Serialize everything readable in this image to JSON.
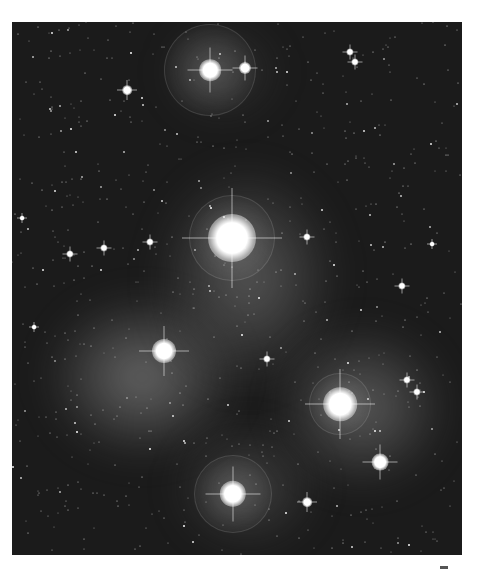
{
  "image": {
    "subject": "Pleiades star cluster with reflection nebula",
    "style": "grayscale astrophotograph",
    "bright_stars": [
      {
        "x": 198,
        "y": 48,
        "r": 9,
        "halo": 45
      },
      {
        "x": 233,
        "y": 46,
        "r": 5,
        "halo": 0
      },
      {
        "x": 220,
        "y": 216,
        "r": 20,
        "halo": 42
      },
      {
        "x": 152,
        "y": 329,
        "r": 10,
        "halo": 0
      },
      {
        "x": 328,
        "y": 382,
        "r": 14,
        "halo": 30
      },
      {
        "x": 368,
        "y": 440,
        "r": 7,
        "halo": 0
      },
      {
        "x": 221,
        "y": 472,
        "r": 11,
        "halo": 38
      },
      {
        "x": 115,
        "y": 68,
        "r": 4,
        "halo": 0
      },
      {
        "x": 338,
        "y": 30,
        "r": 3,
        "halo": 0
      },
      {
        "x": 343,
        "y": 40,
        "r": 3,
        "halo": 0
      },
      {
        "x": 58,
        "y": 232,
        "r": 3,
        "halo": 0
      },
      {
        "x": 92,
        "y": 226,
        "r": 3,
        "halo": 0
      },
      {
        "x": 138,
        "y": 220,
        "r": 3,
        "halo": 0
      },
      {
        "x": 295,
        "y": 215,
        "r": 3,
        "halo": 0
      },
      {
        "x": 390,
        "y": 264,
        "r": 3,
        "halo": 0
      },
      {
        "x": 395,
        "y": 358,
        "r": 3,
        "halo": 0
      },
      {
        "x": 405,
        "y": 370,
        "r": 3,
        "halo": 0
      },
      {
        "x": 255,
        "y": 337,
        "r": 3,
        "halo": 0
      },
      {
        "x": 295,
        "y": 480,
        "r": 4,
        "halo": 0
      },
      {
        "x": 420,
        "y": 222,
        "r": 2,
        "halo": 0
      },
      {
        "x": 10,
        "y": 196,
        "r": 2,
        "halo": 0
      },
      {
        "x": 22,
        "y": 305,
        "r": 2,
        "halo": 0
      }
    ]
  }
}
